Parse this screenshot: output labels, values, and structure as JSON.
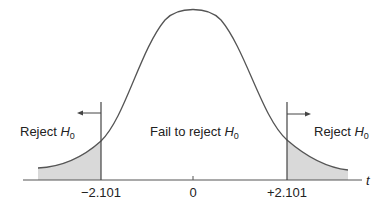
{
  "figure": {
    "type": "t-distribution two-tailed rejection regions",
    "axis_label": "t",
    "ticks": [
      {
        "label": "−2.101",
        "value": -2.101
      },
      {
        "label": "0",
        "value": 0
      },
      {
        "label": "+2.101",
        "value": 2.101
      }
    ],
    "regions": {
      "left": {
        "text": "Reject ",
        "symbol": "H",
        "subscript": "0"
      },
      "center": {
        "text": "Fail to reject ",
        "symbol": "H",
        "subscript": "0"
      },
      "right": {
        "text": "Reject ",
        "symbol": "H",
        "subscript": "0"
      }
    },
    "colors": {
      "curve": "#555555",
      "shade": "#d9d9d9",
      "axis": "#555555"
    }
  }
}
